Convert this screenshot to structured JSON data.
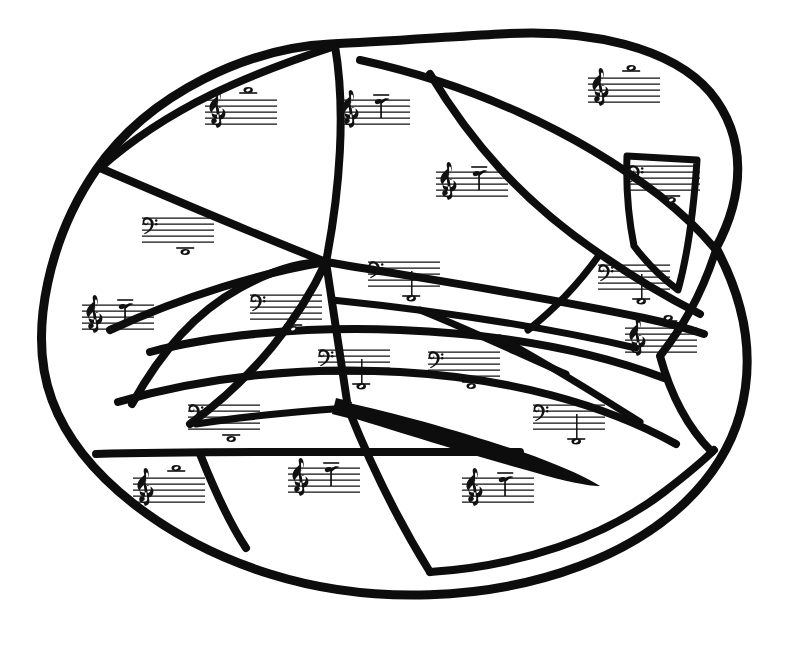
{
  "page": {
    "kind": "line-art coloring page",
    "background_color": "#ffffff",
    "ink_color": "#0d0d0d",
    "width": 793,
    "height": 645
  },
  "legend": {
    "treble_clef_label": "treble-clef",
    "bass_clef_label": "bass-clef",
    "whole_note_label": "whole-note",
    "ledger_line_label": "ledger-line"
  },
  "staves": [
    {
      "id": "staff-01",
      "clef": "treble",
      "note": "whole",
      "note_position": "above-staff-ledger",
      "x": 205,
      "y": 100,
      "scale": 1.0
    },
    {
      "id": "staff-02",
      "clef": "treble",
      "note": "whole",
      "note_position": "high-stem-above",
      "x": 338,
      "y": 100,
      "scale": 1.0
    },
    {
      "id": "staff-03",
      "clef": "treble",
      "note": "whole",
      "note_position": "above-staff-ledger",
      "x": 588,
      "y": 78,
      "scale": 1.0
    },
    {
      "id": "staff-04",
      "clef": "treble",
      "note": "whole",
      "note_position": "high-stem-above",
      "x": 436,
      "y": 172,
      "scale": 1.0
    },
    {
      "id": "staff-05",
      "clef": "bass",
      "note": "whole",
      "note_position": "below-staff-ledger",
      "x": 142,
      "y": 218,
      "scale": 1.0
    },
    {
      "id": "staff-06",
      "clef": "bass",
      "note": "whole",
      "note_position": "below-staff-ledger",
      "x": 628,
      "y": 166,
      "scale": 1.0
    },
    {
      "id": "staff-07",
      "clef": "bass",
      "note": "whole",
      "note_position": "low-stem-below",
      "x": 368,
      "y": 262,
      "scale": 1.0
    },
    {
      "id": "staff-08",
      "clef": "bass",
      "note": "whole",
      "note_position": "low-stem-below",
      "x": 598,
      "y": 265,
      "scale": 1.0
    },
    {
      "id": "staff-09",
      "clef": "treble",
      "note": "whole",
      "note_position": "high-stem-above",
      "x": 82,
      "y": 305,
      "scale": 1.0
    },
    {
      "id": "staff-10",
      "clef": "bass",
      "note": "whole",
      "note_position": "below-staff-ledger",
      "x": 250,
      "y": 295,
      "scale": 1.0
    },
    {
      "id": "staff-11",
      "clef": "bass",
      "note": "whole",
      "note_position": "low-stem-below",
      "x": 318,
      "y": 350,
      "scale": 1.0
    },
    {
      "id": "staff-12",
      "clef": "bass",
      "note": "whole",
      "note_position": "below-staff-ledger",
      "x": 428,
      "y": 352,
      "scale": 1.0
    },
    {
      "id": "staff-13",
      "clef": "treble",
      "note": "whole",
      "note_position": "above-staff-ledger",
      "x": 625,
      "y": 328,
      "scale": 1.0
    },
    {
      "id": "staff-14",
      "clef": "bass",
      "note": "whole",
      "note_position": "below-staff-ledger",
      "x": 188,
      "y": 405,
      "scale": 1.0
    },
    {
      "id": "staff-15",
      "clef": "bass",
      "note": "whole",
      "note_position": "low-stem-below",
      "x": 533,
      "y": 405,
      "scale": 1.0
    },
    {
      "id": "staff-16",
      "clef": "treble",
      "note": "whole",
      "note_position": "above-staff-ledger",
      "x": 133,
      "y": 478,
      "scale": 1.0
    },
    {
      "id": "staff-17",
      "clef": "treble",
      "note": "whole",
      "note_position": "high-stem-above",
      "x": 288,
      "y": 468,
      "scale": 1.0
    },
    {
      "id": "staff-18",
      "clef": "treble",
      "note": "whole",
      "note_position": "high-stem-above",
      "x": 462,
      "y": 478,
      "scale": 1.0
    }
  ],
  "counts": {
    "total_staves": 18,
    "treble_clefs": 8,
    "bass_clefs": 10
  }
}
